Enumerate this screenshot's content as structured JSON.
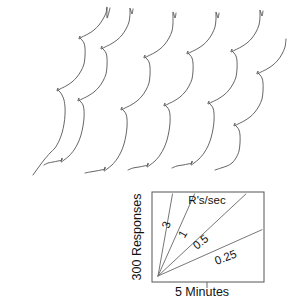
{
  "legend": {
    "units_label": "R's/sec",
    "y_axis_label": "300 Responses",
    "x_axis_label": "5 Minutes",
    "rate_labels": [
      "3",
      "1",
      "0.5",
      "0.25"
    ],
    "rate_values": [
      3,
      1,
      0.5,
      0.25
    ],
    "box": {
      "x": 152,
      "y": 192,
      "width": 112,
      "height": 90
    }
  },
  "colors": {
    "background": "#ffffff",
    "record_line": "#4a4a4a",
    "legend_line": "#666666",
    "box_border": "#555555",
    "text": "#111111"
  },
  "chart_data": {
    "type": "line",
    "xlabel": "5 Minutes",
    "ylabel": "300 Responses",
    "grid": false,
    "legend_position": "inset-bottom-right",
    "series": [
      {
        "name": "record-1",
        "resets": 3,
        "points": [
          [
            33,
            175
          ],
          [
            38,
            168
          ],
          [
            44,
            160
          ],
          [
            50,
            153
          ],
          [
            55,
            148
          ],
          [
            59,
            141
          ],
          [
            62,
            133
          ],
          [
            64,
            124
          ],
          [
            65,
            115
          ],
          [
            65,
            107
          ],
          [
            64,
            100
          ],
          [
            62,
            95
          ],
          [
            60,
            92
          ],
          [
            58,
            90
          ],
          [
            58,
            88
          ],
          [
            57,
            91
          ],
          [
            60,
            89
          ],
          [
            66,
            86
          ],
          [
            72,
            82
          ],
          [
            77,
            77
          ],
          [
            81,
            71
          ],
          [
            84,
            64
          ],
          [
            85,
            56
          ],
          [
            85,
            48
          ],
          [
            84,
            43
          ],
          [
            82,
            40
          ],
          [
            80,
            38
          ],
          [
            80,
            36
          ],
          [
            79,
            39
          ],
          [
            82,
            37
          ],
          [
            88,
            34
          ],
          [
            94,
            30
          ],
          [
            99,
            25
          ],
          [
            103,
            19
          ],
          [
            106,
            13
          ],
          [
            107,
            7
          ],
          [
            107,
            18
          ],
          [
            109,
            12
          ],
          [
            110,
            8
          ]
        ]
      },
      {
        "name": "record-2",
        "resets": 3,
        "points": [
          [
            44,
            165
          ],
          [
            48,
            163
          ],
          [
            53,
            162
          ],
          [
            58,
            161
          ],
          [
            62,
            160
          ],
          [
            62,
            158
          ],
          [
            61,
            162
          ],
          [
            64,
            160
          ],
          [
            69,
            156
          ],
          [
            74,
            150
          ],
          [
            78,
            143
          ],
          [
            81,
            135
          ],
          [
            83,
            126
          ],
          [
            84,
            118
          ],
          [
            84,
            110
          ],
          [
            83,
            105
          ],
          [
            81,
            102
          ],
          [
            79,
            100
          ],
          [
            79,
            98
          ],
          [
            78,
            101
          ],
          [
            82,
            99
          ],
          [
            88,
            96
          ],
          [
            94,
            92
          ],
          [
            99,
            87
          ],
          [
            103,
            81
          ],
          [
            106,
            74
          ],
          [
            107,
            66
          ],
          [
            107,
            58
          ],
          [
            106,
            53
          ],
          [
            104,
            50
          ],
          [
            102,
            48
          ],
          [
            102,
            46
          ],
          [
            101,
            49
          ],
          [
            105,
            47
          ],
          [
            111,
            44
          ],
          [
            117,
            40
          ],
          [
            122,
            35
          ],
          [
            126,
            29
          ],
          [
            129,
            22
          ],
          [
            130,
            14
          ],
          [
            130,
            8
          ],
          [
            132,
            14
          ],
          [
            133,
            9
          ]
        ]
      },
      {
        "name": "record-3",
        "resets": 3,
        "points": [
          [
            85,
            173
          ],
          [
            90,
            172
          ],
          [
            96,
            171
          ],
          [
            101,
            170
          ],
          [
            105,
            169
          ],
          [
            105,
            167
          ],
          [
            104,
            171
          ],
          [
            107,
            169
          ],
          [
            112,
            165
          ],
          [
            117,
            159
          ],
          [
            121,
            152
          ],
          [
            124,
            144
          ],
          [
            126,
            135
          ],
          [
            127,
            127
          ],
          [
            127,
            119
          ],
          [
            126,
            114
          ],
          [
            124,
            111
          ],
          [
            122,
            109
          ],
          [
            122,
            107
          ],
          [
            121,
            110
          ],
          [
            125,
            108
          ],
          [
            131,
            105
          ],
          [
            137,
            101
          ],
          [
            142,
            96
          ],
          [
            146,
            90
          ],
          [
            149,
            83
          ],
          [
            150,
            75
          ],
          [
            150,
            67
          ],
          [
            149,
            62
          ],
          [
            147,
            59
          ],
          [
            145,
            57
          ],
          [
            145,
            55
          ],
          [
            144,
            58
          ],
          [
            148,
            56
          ],
          [
            154,
            53
          ],
          [
            160,
            49
          ],
          [
            165,
            44
          ],
          [
            169,
            38
          ],
          [
            172,
            31
          ],
          [
            173,
            23
          ],
          [
            173,
            12
          ],
          [
            175,
            18
          ],
          [
            176,
            13
          ]
        ]
      },
      {
        "name": "record-4",
        "resets": 3,
        "points": [
          [
            128,
            170
          ],
          [
            133,
            168
          ],
          [
            139,
            167
          ],
          [
            144,
            166
          ],
          [
            148,
            165
          ],
          [
            148,
            163
          ],
          [
            147,
            167
          ],
          [
            150,
            165
          ],
          [
            155,
            161
          ],
          [
            160,
            155
          ],
          [
            164,
            148
          ],
          [
            167,
            140
          ],
          [
            169,
            131
          ],
          [
            170,
            123
          ],
          [
            170,
            115
          ],
          [
            169,
            110
          ],
          [
            167,
            107
          ],
          [
            165,
            105
          ],
          [
            165,
            103
          ],
          [
            164,
            106
          ],
          [
            168,
            104
          ],
          [
            174,
            101
          ],
          [
            180,
            97
          ],
          [
            185,
            92
          ],
          [
            189,
            86
          ],
          [
            192,
            79
          ],
          [
            193,
            71
          ],
          [
            193,
            63
          ],
          [
            192,
            58
          ],
          [
            190,
            55
          ],
          [
            188,
            53
          ],
          [
            188,
            51
          ],
          [
            187,
            54
          ],
          [
            191,
            52
          ],
          [
            197,
            49
          ],
          [
            203,
            45
          ],
          [
            208,
            40
          ],
          [
            212,
            34
          ],
          [
            215,
            27
          ],
          [
            216,
            19
          ],
          [
            216,
            12
          ],
          [
            218,
            18
          ],
          [
            219,
            13
          ]
        ]
      },
      {
        "name": "record-5",
        "resets": 3,
        "points": [
          [
            172,
            168
          ],
          [
            177,
            166
          ],
          [
            183,
            165
          ],
          [
            188,
            164
          ],
          [
            192,
            163
          ],
          [
            192,
            161
          ],
          [
            191,
            165
          ],
          [
            194,
            163
          ],
          [
            199,
            159
          ],
          [
            204,
            153
          ],
          [
            208,
            146
          ],
          [
            211,
            138
          ],
          [
            213,
            129
          ],
          [
            214,
            121
          ],
          [
            214,
            113
          ],
          [
            213,
            108
          ],
          [
            211,
            105
          ],
          [
            209,
            103
          ],
          [
            209,
            101
          ],
          [
            208,
            104
          ],
          [
            212,
            102
          ],
          [
            218,
            99
          ],
          [
            224,
            95
          ],
          [
            229,
            90
          ],
          [
            233,
            84
          ],
          [
            236,
            77
          ],
          [
            237,
            69
          ],
          [
            237,
            61
          ],
          [
            236,
            56
          ],
          [
            234,
            53
          ],
          [
            232,
            51
          ],
          [
            232,
            49
          ],
          [
            231,
            52
          ],
          [
            235,
            50
          ],
          [
            241,
            47
          ],
          [
            247,
            43
          ],
          [
            252,
            38
          ],
          [
            256,
            32
          ],
          [
            259,
            25
          ],
          [
            260,
            17
          ],
          [
            260,
            10
          ],
          [
            262,
            16
          ],
          [
            263,
            11
          ]
        ]
      },
      {
        "name": "record-6",
        "resets": 2,
        "points": [
          [
            215,
            170
          ],
          [
            221,
            168
          ],
          [
            227,
            166
          ],
          [
            232,
            163
          ],
          [
            236,
            158
          ],
          [
            239,
            151
          ],
          [
            240,
            143
          ],
          [
            240,
            135
          ],
          [
            239,
            130
          ],
          [
            237,
            127
          ],
          [
            235,
            125
          ],
          [
            235,
            123
          ],
          [
            234,
            126
          ],
          [
            238,
            124
          ],
          [
            244,
            121
          ],
          [
            250,
            117
          ],
          [
            255,
            112
          ],
          [
            259,
            106
          ],
          [
            262,
            99
          ],
          [
            263,
            91
          ],
          [
            263,
            83
          ],
          [
            262,
            78
          ],
          [
            260,
            75
          ],
          [
            258,
            73
          ],
          [
            258,
            71
          ],
          [
            257,
            74
          ],
          [
            261,
            72
          ],
          [
            267,
            69
          ],
          [
            273,
            65
          ],
          [
            278,
            60
          ],
          [
            282,
            54
          ],
          [
            285,
            47
          ],
          [
            286,
            39
          ]
        ]
      }
    ]
  }
}
